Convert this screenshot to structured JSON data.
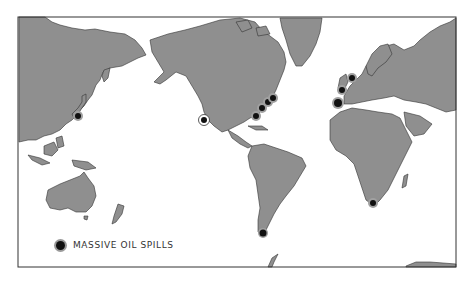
{
  "map": {
    "title": "World map of massive oil spills",
    "projection": "Pacific-centered world map",
    "land_color": "#8f8f8f",
    "ocean_color": "#ffffff",
    "border_color": "#555555",
    "marker_color": "#111111",
    "marker_halo_color": "#a0a0a0"
  },
  "legend": {
    "label": "MASSIVE OIL SPILLS"
  },
  "spills": [
    {
      "region": "Japan",
      "x": 78,
      "y": 116
    },
    {
      "region": "Southern California",
      "x": 204,
      "y": 120
    },
    {
      "region": "Gulf of Mexico",
      "x": 256,
      "y": 116
    },
    {
      "region": "US East Coast (south)",
      "x": 262,
      "y": 108
    },
    {
      "region": "US East Coast (mid)",
      "x": 268,
      "y": 102
    },
    {
      "region": "US East Coast (north)",
      "x": 273,
      "y": 98
    },
    {
      "region": "North Sea",
      "x": 352,
      "y": 78
    },
    {
      "region": "English Channel",
      "x": 342,
      "y": 90
    },
    {
      "region": "Iberian Coast",
      "x": 338,
      "y": 103
    },
    {
      "region": "South Africa",
      "x": 373,
      "y": 203
    },
    {
      "region": "Strait of Magellan",
      "x": 263,
      "y": 233
    }
  ]
}
